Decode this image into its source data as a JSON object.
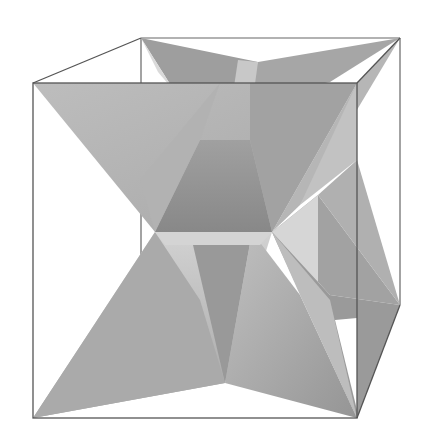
{
  "figure": {
    "background": "#ffffff",
    "edge_color": "#555555",
    "box": {
      "front": [
        [
          33,
          83
        ],
        [
          357,
          83
        ],
        [
          357,
          418
        ],
        [
          33,
          418
        ]
      ],
      "back_top": [
        [
          141,
          38
        ],
        [
          400,
          38
        ]
      ],
      "back_right_bottom": [
        400,
        305
      ],
      "back_left_bottom": [
        141,
        255
      ]
    },
    "faces": [
      {
        "name": "back-top-left",
        "points": [
          [
            141,
            38
          ],
          [
            258,
            62
          ],
          [
            190,
            96
          ]
        ],
        "fill": "#9a9a9a"
      },
      {
        "name": "back-top-right",
        "points": [
          [
            258,
            62
          ],
          [
            400,
            38
          ],
          [
            330,
            82
          ],
          [
            240,
            96
          ]
        ],
        "fill": "#a4a4a4"
      },
      {
        "name": "back-top-sliver",
        "points": [
          [
            141,
            38
          ],
          [
            160,
            70
          ],
          [
            190,
            96
          ]
        ],
        "fill": "#d8d8d8"
      },
      {
        "name": "top-front-left",
        "points": [
          [
            33,
            83
          ],
          [
            240,
            76
          ],
          [
            200,
            180
          ],
          [
            155,
            232
          ]
        ],
        "fill": "#b8b8b8"
      },
      {
        "name": "top-front-mid",
        "points": [
          [
            200,
            140
          ],
          [
            250,
            140
          ],
          [
            272,
            232
          ],
          [
            155,
            232
          ]
        ],
        "fill": "#8c8c8c"
      },
      {
        "name": "top-front-right",
        "points": [
          [
            240,
            76
          ],
          [
            357,
            83
          ],
          [
            272,
            232
          ],
          [
            250,
            140
          ]
        ],
        "fill": "#a8a8a8"
      },
      {
        "name": "top-right-diag",
        "points": [
          [
            357,
            83
          ],
          [
            400,
            38
          ],
          [
            300,
            200
          ],
          [
            272,
            232
          ]
        ],
        "fill": "#b4b4b4"
      },
      {
        "name": "mid-light",
        "points": [
          [
            230,
            70
          ],
          [
            258,
            62
          ],
          [
            250,
            140
          ],
          [
            200,
            140
          ]
        ],
        "fill": "#c4c4c4"
      },
      {
        "name": "right-wing-top",
        "points": [
          [
            272,
            232
          ],
          [
            318,
            195
          ],
          [
            400,
            305
          ],
          [
            330,
            290
          ]
        ],
        "fill": "#a0a0a0"
      },
      {
        "name": "right-wing-light",
        "points": [
          [
            272,
            232
          ],
          [
            318,
            195
          ],
          [
            318,
            300
          ]
        ],
        "fill": "#d4d4d4"
      },
      {
        "name": "right-wing-low",
        "points": [
          [
            272,
            232
          ],
          [
            330,
            290
          ],
          [
            400,
            305
          ],
          [
            357,
            418
          ]
        ],
        "fill": "#989898"
      },
      {
        "name": "bottom-left",
        "points": [
          [
            155,
            232
          ],
          [
            272,
            232
          ],
          [
            210,
            320
          ],
          [
            33,
            418
          ]
        ],
        "fill": "#b0b0b0"
      },
      {
        "name": "bottom-mid-dark",
        "points": [
          [
            190,
            232
          ],
          [
            250,
            232
          ],
          [
            225,
            383
          ]
        ],
        "fill": "#8e8e8e"
      },
      {
        "name": "bottom-left-front",
        "points": [
          [
            155,
            232
          ],
          [
            225,
            383
          ],
          [
            33,
            418
          ]
        ],
        "fill": "#a6a6a6"
      },
      {
        "name": "bottom-right-front",
        "points": [
          [
            250,
            232
          ],
          [
            300,
            290
          ],
          [
            357,
            418
          ],
          [
            225,
            383
          ]
        ],
        "fill": "#a2a2a2"
      },
      {
        "name": "bottom-right-light",
        "points": [
          [
            272,
            232
          ],
          [
            300,
            290
          ],
          [
            335,
            305
          ],
          [
            357,
            418
          ]
        ],
        "fill": "#bcbcbc"
      },
      {
        "name": "upper-white-sliver",
        "points": [
          [
            155,
            232
          ],
          [
            200,
            230
          ],
          [
            190,
            240
          ]
        ],
        "fill": "#e6e6e6"
      }
    ]
  }
}
